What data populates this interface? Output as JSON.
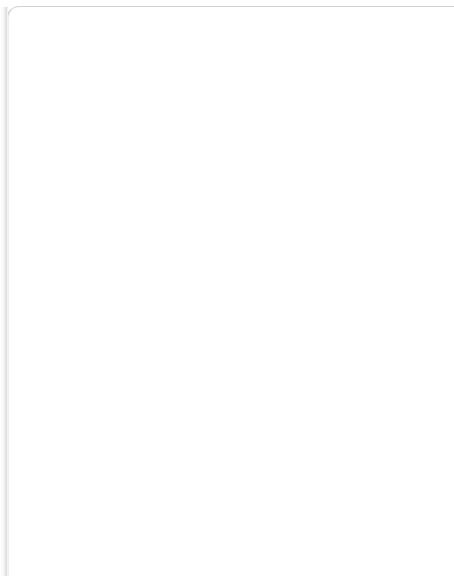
{
  "diagram": {
    "type": "diagram",
    "background": "#ffffff",
    "line_color": "#1a1a1a",
    "box_fill": "#ffffff",
    "box_stroke": "#000000",
    "nodes": [
      {
        "id": "HC",
        "label": "HC",
        "x": 314,
        "y": 22,
        "w": 32,
        "h": 17,
        "level": 14
      },
      {
        "id": "ER",
        "label": "ER",
        "x": 314,
        "y": 47,
        "w": 32,
        "h": 16,
        "level": 13
      },
      {
        "id": "OFC",
        "label": "OFC",
        "x": 172,
        "y": 79,
        "w": 42,
        "h": 15,
        "level": 12
      },
      {
        "id": "36",
        "label": "36",
        "x": 239,
        "y": 79,
        "w": 34,
        "h": 15,
        "level": 12
      },
      {
        "id": "TH",
        "label": "TH",
        "x": 297,
        "y": 78,
        "w": 49,
        "h": 16,
        "level": 12
      },
      {
        "id": "TF",
        "label": "TH",
        "x": 374,
        "y": 78,
        "w": 47,
        "h": 16,
        "level": 12
      },
      {
        "id": "46",
        "label": "46",
        "x": 174,
        "y": 127,
        "w": 35,
        "h": 15,
        "level": 11
      },
      {
        "id": "STPa",
        "label": "STPa",
        "x": 280,
        "y": 126,
        "w": 37,
        "h": 16,
        "level": 11
      },
      {
        "id": "AIT",
        "label": "",
        "x": 344,
        "y": 125,
        "w": 86,
        "h": 15,
        "level": 11,
        "split": [
          {
            "label": "AITd"
          },
          {
            "label": "AITv"
          }
        ],
        "no_divider": true
      },
      {
        "id": "7a",
        "label": "7a",
        "x": 107,
        "y": 167,
        "w": 42,
        "h": 15,
        "level": 10
      },
      {
        "id": "FEF",
        "label": "FEF",
        "x": 209,
        "y": 167,
        "w": 45,
        "h": 15,
        "level": 10
      },
      {
        "id": "STPp",
        "label": "STPp",
        "x": 280,
        "y": 164,
        "w": 37,
        "h": 16,
        "level": 10
      },
      {
        "id": "CIT",
        "label": "",
        "x": 344,
        "y": 166,
        "w": 84,
        "h": 15,
        "level": 10,
        "split": [
          {
            "label": "CITd"
          },
          {
            "label": "CITv"
          }
        ],
        "no_divider": true
      },
      {
        "id": "VIP",
        "label": "VIP",
        "x": 19,
        "y": 208,
        "w": 35,
        "h": 15,
        "level": 9
      },
      {
        "id": "LIP",
        "label": "LIP",
        "x": 80,
        "y": 208,
        "w": 37,
        "h": 15,
        "level": 9
      },
      {
        "id": "MST",
        "label": "",
        "x": 146,
        "y": 207,
        "w": 87,
        "h": 15,
        "level": 9,
        "split": [
          {
            "label": "MSTd"
          },
          {
            "label": "MST1"
          }
        ],
        "no_divider": true
      },
      {
        "id": "FST",
        "label": "FST",
        "x": 289,
        "y": 208,
        "w": 37,
        "h": 15,
        "level": 9
      },
      {
        "id": "PIT",
        "label": "",
        "x": 344,
        "y": 207,
        "w": 84,
        "h": 15,
        "level": 9,
        "split": [
          {
            "label": "PITd"
          },
          {
            "label": "PITv"
          }
        ],
        "no_divider": true
      },
      {
        "id": "VOT",
        "label": "VOT",
        "x": 403,
        "y": 287,
        "w": 34,
        "h": 16,
        "level": 7
      },
      {
        "id": "MDP",
        "label": "MDP",
        "x": 20,
        "y": 312,
        "w": 36,
        "h": 16,
        "level": 6
      },
      {
        "id": "MIP",
        "label": "MIP",
        "x": 78,
        "y": 312,
        "w": 35,
        "h": 16,
        "level": 6
      },
      {
        "id": "PO",
        "label": "PO",
        "x": 138,
        "y": 312,
        "w": 35,
        "h": 16,
        "level": 6
      },
      {
        "id": "MT",
        "label": "MT",
        "x": 194,
        "y": 312,
        "w": 40,
        "h": 16,
        "level": 6
      },
      {
        "id": "V4t",
        "label": "V4t",
        "x": 258,
        "y": 312,
        "w": 36,
        "h": 16,
        "level": 6
      },
      {
        "id": "V4",
        "label": "V4",
        "x": 322,
        "y": 312,
        "w": 55,
        "h": 16,
        "level": 6
      },
      {
        "id": "PIP",
        "label": "PIP",
        "x": 101,
        "y": 374,
        "w": 35,
        "h": 16,
        "level": 5
      },
      {
        "id": "V3A",
        "label": "V3A",
        "x": 286,
        "y": 372,
        "w": 38,
        "h": 16,
        "level": 5
      },
      {
        "id": "V3",
        "label": "V3",
        "x": 110,
        "y": 437,
        "w": 46,
        "h": 15,
        "level": 4
      },
      {
        "id": "VP",
        "label": "VP",
        "x": 284,
        "y": 435,
        "w": 47,
        "h": 15,
        "level": 4
      },
      {
        "id": "V2",
        "label": "",
        "x": 184,
        "y": 462,
        "w": 114,
        "h": 16,
        "level": 3,
        "split": [
          {
            "label": "M"
          },
          {
            "label": "P"
          }
        ],
        "side_label": "V2"
      },
      {
        "id": "V1",
        "label": "",
        "x": 182,
        "y": 489,
        "w": 116,
        "h": 16,
        "level": 2,
        "split": [
          {
            "label": "M"
          },
          {
            "label": "P"
          }
        ],
        "side_label": "V1"
      },
      {
        "id": "LGN",
        "label": "",
        "x": 194,
        "y": 516,
        "w": 98,
        "h": 16,
        "level": 1,
        "split": [
          {
            "label": "M"
          },
          {
            "label": "P"
          }
        ],
        "side_label": "LGN"
      },
      {
        "id": "RGC",
        "label": "",
        "x": 194,
        "y": 542,
        "w": 98,
        "h": 16,
        "level": 0,
        "split": [
          {
            "label": "M"
          },
          {
            "label": "P"
          }
        ],
        "side_label": "RGC"
      }
    ],
    "side_labels": [
      {
        "text": "V2",
        "x": 303,
        "y": 470
      },
      {
        "text": "V1",
        "x": 303,
        "y": 497
      },
      {
        "text": "LGN",
        "x": 298,
        "y": 524
      },
      {
        "text": "RGC",
        "x": 298,
        "y": 550
      }
    ],
    "spine_edges": [
      {
        "from": "RGC",
        "to": "LGN"
      },
      {
        "from": "LGN",
        "to": "V1"
      },
      {
        "from": "V1",
        "to": "V2"
      },
      {
        "from": "HC",
        "to": "ER"
      }
    ],
    "edges": [
      {
        "from": "V1",
        "to": "V2"
      },
      {
        "from": "V1",
        "to": "V3"
      },
      {
        "from": "V1",
        "to": "VP"
      },
      {
        "from": "V1",
        "to": "V4"
      },
      {
        "from": "V1",
        "to": "MT"
      },
      {
        "from": "V1",
        "to": "PO"
      },
      {
        "from": "V1",
        "to": "V3A"
      },
      {
        "from": "V1",
        "to": "PIP"
      },
      {
        "from": "V2",
        "to": "V3"
      },
      {
        "from": "V2",
        "to": "VP"
      },
      {
        "from": "V2",
        "to": "V4"
      },
      {
        "from": "V2",
        "to": "V4t"
      },
      {
        "from": "V2",
        "to": "MT"
      },
      {
        "from": "V2",
        "to": "V3A"
      },
      {
        "from": "V2",
        "to": "PO"
      },
      {
        "from": "V2",
        "to": "PIP"
      },
      {
        "from": "V2",
        "to": "VOT"
      },
      {
        "from": "V2",
        "to": "MSTd"
      },
      {
        "from": "V3",
        "to": "V4"
      },
      {
        "from": "V3",
        "to": "V4t"
      },
      {
        "from": "V3",
        "to": "MT"
      },
      {
        "from": "V3",
        "to": "V3A"
      },
      {
        "from": "V3",
        "to": "PO"
      },
      {
        "from": "V3",
        "to": "PIP"
      },
      {
        "from": "V3",
        "to": "LIP"
      },
      {
        "from": "V3",
        "to": "MSTd"
      },
      {
        "from": "V3",
        "to": "FST"
      },
      {
        "from": "V3",
        "to": "MIP"
      },
      {
        "from": "VP",
        "to": "V4"
      },
      {
        "from": "VP",
        "to": "V4t"
      },
      {
        "from": "VP",
        "to": "MT"
      },
      {
        "from": "VP",
        "to": "V3A"
      },
      {
        "from": "VP",
        "to": "VOT"
      },
      {
        "from": "VP",
        "to": "PIT"
      },
      {
        "from": "VP",
        "to": "MSTd"
      },
      {
        "from": "V3A",
        "to": "V4"
      },
      {
        "from": "V3A",
        "to": "MT"
      },
      {
        "from": "V3A",
        "to": "LIP"
      },
      {
        "from": "V3A",
        "to": "PIP"
      },
      {
        "from": "V3A",
        "to": "VIP"
      },
      {
        "from": "V3A",
        "to": "MSTd"
      },
      {
        "from": "V3A",
        "to": "FST"
      },
      {
        "from": "V3A",
        "to": "STPp"
      },
      {
        "from": "V3A",
        "to": "7a"
      },
      {
        "from": "V3A",
        "to": "PO"
      },
      {
        "from": "PIP",
        "to": "PO"
      },
      {
        "from": "PIP",
        "to": "LIP"
      },
      {
        "from": "PIP",
        "to": "VIP"
      },
      {
        "from": "PIP",
        "to": "MIP"
      },
      {
        "from": "PIP",
        "to": "MDP"
      },
      {
        "from": "PIP",
        "to": "7a"
      },
      {
        "from": "PIP",
        "to": "V4"
      },
      {
        "from": "PIP",
        "to": "MT"
      },
      {
        "from": "PO",
        "to": "MT"
      },
      {
        "from": "PO",
        "to": "V4"
      },
      {
        "from": "PO",
        "to": "LIP"
      },
      {
        "from": "PO",
        "to": "VIP"
      },
      {
        "from": "PO",
        "to": "MIP"
      },
      {
        "from": "PO",
        "to": "MDP"
      },
      {
        "from": "PO",
        "to": "MSTd"
      },
      {
        "from": "PO",
        "to": "7a"
      },
      {
        "from": "PO",
        "to": "FEF"
      },
      {
        "from": "MT",
        "to": "V4t"
      },
      {
        "from": "MT",
        "to": "V4"
      },
      {
        "from": "MT",
        "to": "MSTd"
      },
      {
        "from": "MT",
        "to": "MST1"
      },
      {
        "from": "MT",
        "to": "FST"
      },
      {
        "from": "MT",
        "to": "LIP"
      },
      {
        "from": "MT",
        "to": "VIP"
      },
      {
        "from": "MT",
        "to": "7a"
      },
      {
        "from": "MT",
        "to": "STPp"
      },
      {
        "from": "MT",
        "to": "FEF"
      },
      {
        "from": "MT",
        "to": "PITd"
      },
      {
        "from": "V4t",
        "to": "MSTd"
      },
      {
        "from": "V4t",
        "to": "FST"
      },
      {
        "from": "V4t",
        "to": "MST1"
      },
      {
        "from": "V4t",
        "to": "V4"
      },
      {
        "from": "V4",
        "to": "PIT"
      },
      {
        "from": "V4",
        "to": "VOT"
      },
      {
        "from": "V4",
        "to": "CIT"
      },
      {
        "from": "V4",
        "to": "AIT"
      },
      {
        "from": "V4",
        "to": "FST"
      },
      {
        "from": "V4",
        "to": "MSTd"
      },
      {
        "from": "V4",
        "to": "LIP"
      },
      {
        "from": "V4",
        "to": "VIP"
      },
      {
        "from": "V4",
        "to": "7a"
      },
      {
        "from": "V4",
        "to": "FEF"
      },
      {
        "from": "V4",
        "to": "STPp"
      },
      {
        "from": "V4",
        "to": "TF"
      },
      {
        "from": "VOT",
        "to": "PIT"
      },
      {
        "from": "VOT",
        "to": "CIT"
      },
      {
        "from": "VOT",
        "to": "AIT"
      },
      {
        "from": "VOT",
        "to": "TF"
      },
      {
        "from": "PIT",
        "to": "CIT"
      },
      {
        "from": "PIT",
        "to": "AIT"
      },
      {
        "from": "PIT",
        "to": "STPp"
      },
      {
        "from": "PIT",
        "to": "FEF"
      },
      {
        "from": "PIT",
        "to": "TF"
      },
      {
        "from": "PIT",
        "to": "36"
      },
      {
        "from": "CIT",
        "to": "AIT"
      },
      {
        "from": "CIT",
        "to": "STPp"
      },
      {
        "from": "CIT",
        "to": "STPa"
      },
      {
        "from": "CIT",
        "to": "TF"
      },
      {
        "from": "CIT",
        "to": "36"
      },
      {
        "from": "CIT",
        "to": "FEF"
      },
      {
        "from": "CIT",
        "to": "TH"
      },
      {
        "from": "AIT",
        "to": "STPa"
      },
      {
        "from": "AIT",
        "to": "STPp"
      },
      {
        "from": "AIT",
        "to": "36"
      },
      {
        "from": "AIT",
        "to": "TF"
      },
      {
        "from": "AIT",
        "to": "TH"
      },
      {
        "from": "AIT",
        "to": "46"
      },
      {
        "from": "AIT",
        "to": "ER"
      },
      {
        "from": "AIT",
        "to": "OFC"
      },
      {
        "from": "FST",
        "to": "MST1"
      },
      {
        "from": "FST",
        "to": "STPp"
      },
      {
        "from": "FST",
        "to": "STPa"
      },
      {
        "from": "FST",
        "to": "7a"
      },
      {
        "from": "FST",
        "to": "LIP"
      },
      {
        "from": "FST",
        "to": "FEF"
      },
      {
        "from": "FST",
        "to": "CIT"
      },
      {
        "from": "FST",
        "to": "PIT"
      },
      {
        "from": "MSTd",
        "to": "MST1"
      },
      {
        "from": "MSTd",
        "to": "7a"
      },
      {
        "from": "MSTd",
        "to": "LIP"
      },
      {
        "from": "MSTd",
        "to": "VIP"
      },
      {
        "from": "MSTd",
        "to": "STPp"
      },
      {
        "from": "MSTd",
        "to": "FEF"
      },
      {
        "from": "MSTd",
        "to": "STPa"
      },
      {
        "from": "LIP",
        "to": "7a"
      },
      {
        "from": "LIP",
        "to": "VIP"
      },
      {
        "from": "LIP",
        "to": "FEF"
      },
      {
        "from": "LIP",
        "to": "STPp"
      },
      {
        "from": "LIP",
        "to": "MIP"
      },
      {
        "from": "LIP",
        "to": "46"
      },
      {
        "from": "VIP",
        "to": "7a"
      },
      {
        "from": "VIP",
        "to": "MIP"
      },
      {
        "from": "VIP",
        "to": "FEF"
      },
      {
        "from": "VIP",
        "to": "MDP"
      },
      {
        "from": "MIP",
        "to": "7a"
      },
      {
        "from": "MDP",
        "to": "7a"
      },
      {
        "from": "7a",
        "to": "STPp"
      },
      {
        "from": "7a",
        "to": "STPa"
      },
      {
        "from": "7a",
        "to": "FEF"
      },
      {
        "from": "7a",
        "to": "46"
      },
      {
        "from": "7a",
        "to": "ER"
      },
      {
        "from": "7a",
        "to": "TF"
      },
      {
        "from": "FEF",
        "to": "STPp"
      },
      {
        "from": "FEF",
        "to": "STPa"
      },
      {
        "from": "FEF",
        "to": "46"
      },
      {
        "from": "FEF",
        "to": "TH"
      },
      {
        "from": "STPp",
        "to": "STPa"
      },
      {
        "from": "STPp",
        "to": "46"
      },
      {
        "from": "STPp",
        "to": "TF"
      },
      {
        "from": "STPp",
        "to": "36"
      },
      {
        "from": "STPa",
        "to": "46"
      },
      {
        "from": "STPa",
        "to": "TF"
      },
      {
        "from": "STPa",
        "to": "36"
      },
      {
        "from": "STPa",
        "to": "ER"
      },
      {
        "from": "STPa",
        "to": "TH"
      },
      {
        "from": "46",
        "to": "TF"
      },
      {
        "from": "46",
        "to": "36"
      },
      {
        "from": "46",
        "to": "OFC"
      },
      {
        "from": "46",
        "to": "ER"
      },
      {
        "from": "OFC",
        "to": "36"
      },
      {
        "from": "OFC",
        "to": "TH"
      },
      {
        "from": "OFC",
        "to": "ER"
      },
      {
        "from": "OFC",
        "to": "TF"
      },
      {
        "from": "36",
        "to": "TH"
      },
      {
        "from": "36",
        "to": "TF"
      },
      {
        "from": "36",
        "to": "ER"
      },
      {
        "from": "TF",
        "to": "ER"
      },
      {
        "from": "TH",
        "to": "ER"
      },
      {
        "from": "TH",
        "to": "TF"
      },
      {
        "from": "ER",
        "to": "HC"
      }
    ]
  }
}
